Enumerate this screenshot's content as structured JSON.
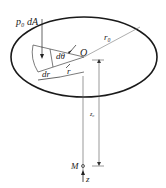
{
  "diagram": {
    "labels": {
      "force": "p₀ dA",
      "dtheta": "dθ",
      "origin": "O",
      "radius_outer": "r₀",
      "r": "r",
      "dr": "dr",
      "z0": "z₀",
      "point": "M",
      "axis": "z"
    },
    "colors": {
      "stroke": "#1a1a1a",
      "thin": "#555555"
    }
  }
}
